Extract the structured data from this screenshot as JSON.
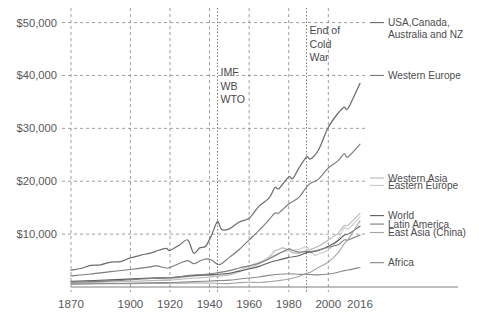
{
  "chart_data": {
    "type": "line",
    "title": "",
    "subtitle": "",
    "xlabel": "",
    "ylabel": "",
    "xlim": [
      1870,
      2016
    ],
    "ylim": [
      0,
      52000
    ],
    "grid": true,
    "grid_axis": "both",
    "legend_position": "right",
    "y_ticks": [
      10000,
      20000,
      30000,
      40000,
      50000
    ],
    "y_tick_labels": [
      "$10,000",
      "$20,000",
      "$30,000",
      "$40,000",
      "$50,000"
    ],
    "x_ticks": [
      1870,
      1900,
      1920,
      1940,
      1960,
      1980,
      2000,
      2016
    ],
    "x_tick_labels": [
      "1870",
      "1900",
      "1920",
      "1940",
      "1960",
      "1980",
      "2000",
      "2016"
    ],
    "x_gridlines": [
      1870,
      1900,
      1920,
      1940,
      1960,
      1980,
      2000
    ],
    "annotations": [
      {
        "name": "imf-wb-wto",
        "lines": [
          "IMF",
          "WB",
          "WTO"
        ],
        "x_year": 1944,
        "marker_line": true
      },
      {
        "name": "end-of-cold-war",
        "lines": [
          "End of",
          "Cold",
          "War"
        ],
        "x_year": 1989,
        "marker_line": true
      }
    ],
    "series": [
      {
        "name": "USA,Canada, Australia and NZ",
        "legend_lines": [
          "USA,Canada,",
          "Australia and NZ"
        ],
        "color": "#6d6d6f",
        "width": 1.25,
        "x": [
          1870,
          1875,
          1880,
          1885,
          1890,
          1895,
          1900,
          1905,
          1910,
          1913,
          1918,
          1920,
          1925,
          1929,
          1932,
          1935,
          1938,
          1941,
          1944,
          1946,
          1950,
          1955,
          1960,
          1965,
          1970,
          1973,
          1975,
          1980,
          1982,
          1985,
          1989,
          1991,
          1995,
          2000,
          2005,
          2008,
          2010,
          2016
        ],
        "y": [
          3200,
          3500,
          4100,
          4200,
          4700,
          4800,
          5500,
          6000,
          6400,
          6800,
          7300,
          6900,
          8000,
          8900,
          6400,
          7400,
          7700,
          9800,
          12400,
          10900,
          11000,
          12300,
          13000,
          15300,
          16800,
          18800,
          18600,
          20800,
          20500,
          22400,
          24600,
          24200,
          25900,
          30200,
          32900,
          34000,
          33800,
          38500
        ],
        "label_y": 50000
      },
      {
        "name": "Western Europe",
        "legend_lines": [
          "Western Europe"
        ],
        "color": "#7b7b7d",
        "width": 1.15,
        "x": [
          1870,
          1880,
          1890,
          1900,
          1910,
          1913,
          1918,
          1920,
          1925,
          1929,
          1932,
          1935,
          1938,
          1941,
          1944,
          1946,
          1950,
          1955,
          1960,
          1965,
          1970,
          1973,
          1975,
          1980,
          1985,
          1989,
          1991,
          1995,
          2000,
          2005,
          2008,
          2010,
          2016
        ],
        "y": [
          2100,
          2450,
          2900,
          3300,
          3800,
          4000,
          3600,
          3700,
          4500,
          5000,
          4400,
          4900,
          5300,
          5100,
          4300,
          4400,
          5600,
          7100,
          8900,
          10700,
          12700,
          14000,
          14000,
          15700,
          16900,
          18900,
          19600,
          20400,
          22500,
          23900,
          25200,
          24600,
          27000
        ],
        "label_y": 40000
      },
      {
        "name": "Western Asia",
        "legend_lines": [
          "Western Asia"
        ],
        "color": "#b9b9bb",
        "width": 1.1,
        "x": [
          1870,
          1890,
          1910,
          1920,
          1930,
          1940,
          1950,
          1955,
          1960,
          1965,
          1970,
          1973,
          1975,
          1977,
          1980,
          1982,
          1985,
          1989,
          1991,
          1995,
          2000,
          2005,
          2008,
          2010,
          2016
        ],
        "y": [
          800,
          950,
          1200,
          1300,
          1600,
          1900,
          2300,
          2900,
          3600,
          4400,
          5700,
          6800,
          7100,
          7400,
          6900,
          6500,
          6400,
          6900,
          7100,
          7700,
          8900,
          10200,
          11600,
          11700,
          13900
        ],
        "label_y": 20600
      },
      {
        "name": "Eastern Europe",
        "legend_lines": [
          "Eastern Europe"
        ],
        "color": "#c9c9cb",
        "width": 1.1,
        "x": [
          1870,
          1890,
          1910,
          1920,
          1930,
          1938,
          1944,
          1950,
          1955,
          1960,
          1965,
          1970,
          1975,
          1980,
          1985,
          1989,
          1991,
          1993,
          1995,
          2000,
          2005,
          2008,
          2010,
          2016
        ],
        "y": [
          1000,
          1250,
          1600,
          1500,
          2000,
          2200,
          2100,
          2500,
          3100,
          4000,
          4700,
          5500,
          6400,
          6900,
          7100,
          7600,
          6700,
          6000,
          6200,
          7000,
          9000,
          11200,
          11000,
          13200
        ],
        "label_y": 19200
      },
      {
        "name": "World",
        "legend_lines": [
          "World"
        ],
        "color": "#5e5e60",
        "width": 1.1,
        "x": [
          1870,
          1890,
          1910,
          1920,
          1930,
          1938,
          1944,
          1950,
          1955,
          1960,
          1965,
          1970,
          1975,
          1980,
          1985,
          1989,
          1991,
          1995,
          2000,
          2005,
          2008,
          2010,
          2016
        ],
        "y": [
          1100,
          1350,
          1700,
          1750,
          2100,
          2300,
          2400,
          2600,
          3000,
          3400,
          3900,
          4600,
          5100,
          5600,
          5900,
          6500,
          6600,
          6900,
          7700,
          8800,
          9800,
          10000,
          11500
        ],
        "label_y": 13500
      },
      {
        "name": "Latin America",
        "legend_lines": [
          "Latin America"
        ],
        "color": "#7f7f81",
        "width": 1.1,
        "x": [
          1870,
          1890,
          1910,
          1920,
          1930,
          1938,
          1944,
          1950,
          1955,
          1960,
          1965,
          1970,
          1975,
          1980,
          1982,
          1985,
          1989,
          1991,
          1995,
          2000,
          2005,
          2008,
          2010,
          2016
        ],
        "y": [
          900,
          1150,
          1600,
          1750,
          2200,
          2400,
          2700,
          3100,
          3600,
          4000,
          4500,
          5300,
          6300,
          7200,
          6900,
          6600,
          6700,
          6700,
          7000,
          7500,
          8000,
          8900,
          8900,
          9800
        ],
        "label_y": 11900
      },
      {
        "name": "East Asia (China)",
        "legend_lines": [
          "East Asia (China)"
        ],
        "color": "#a6a6a8",
        "width": 1.1,
        "x": [
          1870,
          1890,
          1910,
          1920,
          1930,
          1938,
          1944,
          1950,
          1955,
          1960,
          1965,
          1970,
          1975,
          1980,
          1985,
          1989,
          1991,
          1995,
          2000,
          2005,
          2008,
          2010,
          2016
        ],
        "y": [
          600,
          620,
          680,
          700,
          780,
          750,
          700,
          640,
          820,
          900,
          850,
          1000,
          1200,
          1500,
          2000,
          2600,
          2800,
          3700,
          4700,
          6500,
          8200,
          9000,
          12500
        ],
        "label_y": 10300
      },
      {
        "name": "Africa",
        "legend_lines": [
          "Africa"
        ],
        "color": "#8a8a8c",
        "width": 1.1,
        "x": [
          1870,
          1890,
          1910,
          1920,
          1930,
          1938,
          1944,
          1950,
          1955,
          1960,
          1965,
          1970,
          1975,
          1980,
          1985,
          1989,
          1991,
          1995,
          2000,
          2005,
          2008,
          2010,
          2016
        ],
        "y": [
          550,
          650,
          800,
          850,
          1000,
          1100,
          1200,
          1300,
          1500,
          1700,
          1900,
          2200,
          2400,
          2500,
          2400,
          2400,
          2350,
          2300,
          2450,
          2800,
          3100,
          3200,
          3700
        ],
        "label_y": 4600
      }
    ]
  },
  "colors": {
    "background": "#ffffff",
    "grid": "#8e8e90",
    "axis": "#6f6f71",
    "text": "#58585a"
  }
}
